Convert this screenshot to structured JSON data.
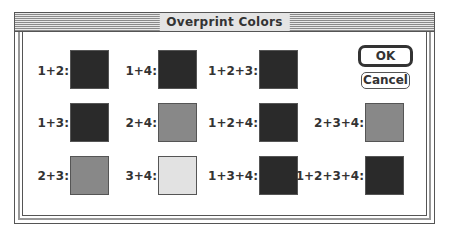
{
  "window": {
    "title": "Overprint Colors"
  },
  "buttons": {
    "ok": "OK",
    "cancel": "Cancel"
  },
  "colors": {
    "dark": "#2a2a2a",
    "medium": "#888888",
    "light": "#e2e2e2"
  },
  "swatches": [
    {
      "label": "1+2:",
      "color": "#2a2a2a",
      "row": 0,
      "col": 0
    },
    {
      "label": "1+4:",
      "color": "#2a2a2a",
      "row": 0,
      "col": 1
    },
    {
      "label": "1+2+3:",
      "color": "#2a2a2a",
      "row": 0,
      "col": 2
    },
    {
      "label": "1+3:",
      "color": "#2a2a2a",
      "row": 1,
      "col": 0
    },
    {
      "label": "2+4:",
      "color": "#888888",
      "row": 1,
      "col": 1
    },
    {
      "label": "1+2+4:",
      "color": "#2a2a2a",
      "row": 1,
      "col": 2
    },
    {
      "label": "2+3+4:",
      "color": "#888888",
      "row": 1,
      "col": 3
    },
    {
      "label": "2+3:",
      "color": "#888888",
      "row": 2,
      "col": 0
    },
    {
      "label": "3+4:",
      "color": "#e2e2e2",
      "row": 2,
      "col": 1
    },
    {
      "label": "1+3+4:",
      "color": "#2a2a2a",
      "row": 2,
      "col": 2
    },
    {
      "label": "1+2+3+4:",
      "color": "#2a2a2a",
      "row": 2,
      "col": 3
    }
  ]
}
